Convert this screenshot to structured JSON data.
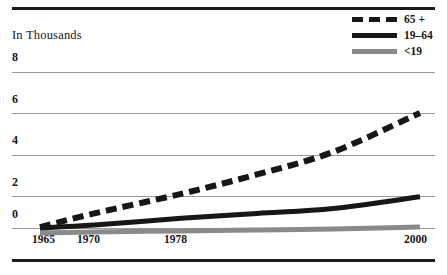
{
  "chart_data": {
    "type": "line",
    "title": "",
    "subtitle": "",
    "xlabel": "",
    "ylabel": "In Thousands",
    "axis_note": "In Thousands",
    "xlim": [
      1965,
      2000
    ],
    "ylim": [
      0,
      8
    ],
    "grid": true,
    "legend_position": "top-right",
    "x_tick_labels": [
      "1965",
      "1970",
      "1978",
      "2000"
    ],
    "x_ticks": [
      1965,
      1970,
      1978,
      2000
    ],
    "y_tick_labels": [
      "0",
      "2",
      "4",
      "6",
      "8"
    ],
    "y_ticks": [
      0,
      2,
      4,
      6,
      8
    ],
    "series": [
      {
        "name": "65 +",
        "style": "dashed",
        "color": "#17171a",
        "x": [
          1965,
          1970,
          1978,
          1985,
          1992,
          2000
        ],
        "values": [
          0.05,
          0.75,
          1.75,
          2.75,
          3.9,
          5.9
        ]
      },
      {
        "name": "19–64",
        "style": "solid",
        "color": "#17171a",
        "x": [
          1965,
          1970,
          1978,
          1985,
          1992,
          2000
        ],
        "values": [
          0.0,
          0.15,
          0.5,
          0.75,
          1.0,
          1.6
        ]
      },
      {
        "name": "<19",
        "style": "solid",
        "color": "#8a8a8a",
        "x": [
          1965,
          1970,
          1978,
          1985,
          1992,
          2000
        ],
        "values": [
          -0.25,
          -0.2,
          -0.15,
          -0.1,
          -0.05,
          0.05
        ]
      }
    ]
  },
  "legend": {
    "entries": [
      {
        "label": "65 +",
        "style": "dashed",
        "color": "#17171a"
      },
      {
        "label": "19–64",
        "style": "solid-dark",
        "color": "#17171a"
      },
      {
        "label": "<19",
        "style": "solid-gray",
        "color": "#8a8a8a"
      }
    ]
  },
  "colors": {
    "rule": "#1c1c1c",
    "gridline": "#9a9a9a",
    "text": "#17171a",
    "series_dark": "#17171a",
    "series_gray": "#8a8a8a",
    "background": "#ffffff"
  }
}
